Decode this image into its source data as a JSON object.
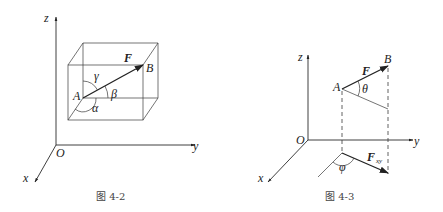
{
  "figures": [
    {
      "caption": "图 4-2",
      "labels": {
        "z": "z",
        "y": "y",
        "x": "x",
        "origin": "O",
        "point_a": "A",
        "point_b": "B",
        "force": "F",
        "alpha": "α",
        "beta": "β",
        "gamma": "γ"
      }
    },
    {
      "caption": "图 4-3",
      "labels": {
        "z": "z",
        "y": "y",
        "x": "x",
        "origin": "O",
        "point_a": "A",
        "point_b": "B",
        "force": "F",
        "theta": "θ",
        "phi": "φ",
        "force_xy": "F",
        "force_xy_sub": "xy"
      }
    }
  ],
  "colors": {
    "line": "#2a2a2a",
    "text": "#222222",
    "caption": "#444444",
    "background": "#ffffff"
  }
}
